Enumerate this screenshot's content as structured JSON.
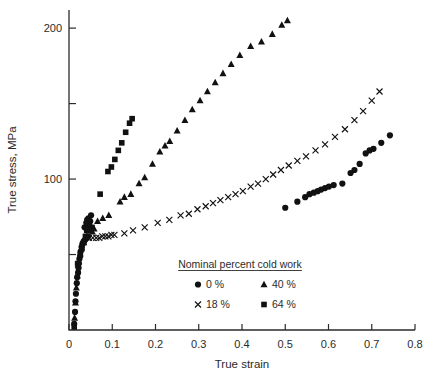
{
  "figure": {
    "kind": "scatter-plot",
    "background": "#ffffff",
    "marker_color": "#111111",
    "axis_color": "#2b2b2b"
  },
  "chart_data": {
    "type": "scatter",
    "title": "",
    "xlabel": "True strain",
    "ylabel": "True stress, MPa",
    "xlim": [
      0,
      0.8
    ],
    "ylim": [
      0,
      212
    ],
    "grid": false,
    "legend_position": "inside-bottom-center",
    "legend_title": "Nominal percent cold work",
    "xticks": [
      0,
      0.1,
      0.2,
      0.3,
      0.4,
      0.5,
      0.6,
      0.7,
      0.8
    ],
    "xticklabels": [
      "0",
      "0.1",
      "0.2",
      "0.3",
      "0.4",
      "0.5",
      "0.6",
      "0.7",
      "0.8"
    ],
    "yticks": [
      0,
      50,
      100,
      150,
      200
    ],
    "yticklabels": [
      "",
      "",
      "100",
      "",
      "200"
    ],
    "ytick_labeled": [
      100,
      200
    ],
    "series": [
      {
        "name": "0 %",
        "label": "0 %",
        "marker": "circle",
        "points": [
          [
            0.012,
            4
          ],
          [
            0.014,
            12
          ],
          [
            0.015,
            19
          ],
          [
            0.016,
            24
          ],
          [
            0.018,
            31
          ],
          [
            0.019,
            35
          ],
          [
            0.021,
            38
          ],
          [
            0.022,
            41
          ],
          [
            0.023,
            44
          ],
          [
            0.024,
            47
          ],
          [
            0.026,
            49
          ],
          [
            0.027,
            52
          ],
          [
            0.029,
            55
          ],
          [
            0.031,
            57
          ],
          [
            0.033,
            58
          ],
          [
            0.035,
            59
          ],
          [
            0.038,
            60
          ],
          [
            0.041,
            61
          ],
          [
            0.044,
            62
          ],
          [
            0.036,
            68
          ],
          [
            0.04,
            71
          ],
          [
            0.042,
            73
          ],
          [
            0.045,
            74
          ],
          [
            0.047,
            69
          ],
          [
            0.049,
            72
          ],
          [
            0.051,
            76
          ],
          [
            0.5,
            81
          ],
          [
            0.528,
            85
          ],
          [
            0.546,
            88
          ],
          [
            0.556,
            90
          ],
          [
            0.566,
            91
          ],
          [
            0.575,
            92
          ],
          [
            0.583,
            93
          ],
          [
            0.592,
            94
          ],
          [
            0.601,
            95
          ],
          [
            0.612,
            96
          ],
          [
            0.632,
            97
          ],
          [
            0.651,
            104
          ],
          [
            0.66,
            106
          ],
          [
            0.672,
            110
          ],
          [
            0.686,
            117
          ],
          [
            0.695,
            119
          ],
          [
            0.704,
            120
          ],
          [
            0.722,
            124
          ],
          [
            0.742,
            129
          ]
        ]
      },
      {
        "name": "18 %",
        "label": "18 %",
        "marker": "x",
        "points": [
          [
            0.046,
            61
          ],
          [
            0.055,
            61
          ],
          [
            0.063,
            61
          ],
          [
            0.07,
            61
          ],
          [
            0.077,
            62
          ],
          [
            0.084,
            62
          ],
          [
            0.091,
            62
          ],
          [
            0.098,
            63
          ],
          [
            0.105,
            63
          ],
          [
            0.128,
            64
          ],
          [
            0.148,
            66
          ],
          [
            0.175,
            68
          ],
          [
            0.205,
            71
          ],
          [
            0.232,
            73
          ],
          [
            0.258,
            76
          ],
          [
            0.277,
            77
          ],
          [
            0.297,
            80
          ],
          [
            0.316,
            82
          ],
          [
            0.333,
            84
          ],
          [
            0.35,
            86
          ],
          [
            0.368,
            88
          ],
          [
            0.385,
            90
          ],
          [
            0.402,
            92
          ],
          [
            0.42,
            95
          ],
          [
            0.437,
            97
          ],
          [
            0.455,
            100
          ],
          [
            0.472,
            103
          ],
          [
            0.49,
            106
          ],
          [
            0.508,
            109
          ],
          [
            0.528,
            112
          ],
          [
            0.548,
            115
          ],
          [
            0.57,
            119
          ],
          [
            0.592,
            123
          ],
          [
            0.615,
            128
          ],
          [
            0.638,
            133
          ],
          [
            0.66,
            139
          ],
          [
            0.68,
            145
          ],
          [
            0.7,
            152
          ],
          [
            0.718,
            158
          ]
        ]
      },
      {
        "name": "40 %",
        "label": "40 %",
        "marker": "triangle",
        "points": [
          [
            0.013,
            8
          ],
          [
            0.015,
            18
          ],
          [
            0.017,
            28
          ],
          [
            0.019,
            36
          ],
          [
            0.021,
            43
          ],
          [
            0.028,
            54
          ],
          [
            0.034,
            58
          ],
          [
            0.04,
            62
          ],
          [
            0.046,
            66
          ],
          [
            0.05,
            68
          ],
          [
            0.054,
            65
          ],
          [
            0.058,
            67
          ],
          [
            0.066,
            72
          ],
          [
            0.078,
            74
          ],
          [
            0.092,
            76
          ],
          [
            0.118,
            85
          ],
          [
            0.128,
            88
          ],
          [
            0.143,
            90
          ],
          [
            0.162,
            97
          ],
          [
            0.175,
            101
          ],
          [
            0.193,
            110
          ],
          [
            0.21,
            118
          ],
          [
            0.222,
            122
          ],
          [
            0.233,
            125
          ],
          [
            0.25,
            132
          ],
          [
            0.268,
            139
          ],
          [
            0.285,
            146
          ],
          [
            0.303,
            152
          ],
          [
            0.32,
            158
          ],
          [
            0.338,
            164
          ],
          [
            0.356,
            170
          ],
          [
            0.375,
            176
          ],
          [
            0.395,
            182
          ],
          [
            0.42,
            188
          ],
          [
            0.445,
            191
          ],
          [
            0.47,
            196
          ],
          [
            0.492,
            202
          ],
          [
            0.505,
            205
          ]
        ]
      },
      {
        "name": "64 %",
        "label": "64 %",
        "marker": "square",
        "points": [
          [
            0.012,
            2
          ],
          [
            0.02,
            44
          ],
          [
            0.026,
            50
          ],
          [
            0.03,
            54
          ],
          [
            0.034,
            58
          ],
          [
            0.038,
            62
          ],
          [
            0.041,
            66
          ],
          [
            0.044,
            69
          ],
          [
            0.047,
            71
          ],
          [
            0.05,
            66
          ],
          [
            0.053,
            68
          ],
          [
            0.072,
            90
          ],
          [
            0.09,
            105
          ],
          [
            0.098,
            108
          ],
          [
            0.106,
            113
          ],
          [
            0.114,
            119
          ],
          [
            0.122,
            124
          ],
          [
            0.131,
            131
          ],
          [
            0.14,
            137
          ],
          [
            0.146,
            140
          ]
        ]
      }
    ]
  }
}
